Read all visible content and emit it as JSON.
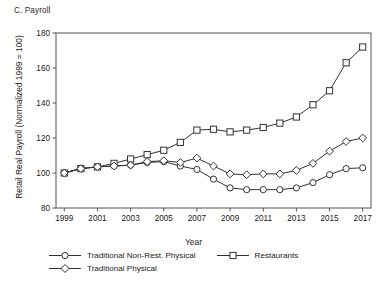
{
  "figure": {
    "panel_title": "C. Payroll",
    "ylabel": "Retail Real Payroll (Normalized 1999 = 100)",
    "xlabel": "Year"
  },
  "legend": {
    "items": [
      {
        "label": "Traditional Non-Rest. Physical",
        "marker": "circle-marker"
      },
      {
        "label": "Restaurants",
        "marker": "square-marker"
      },
      {
        "label": "Traditional Physical",
        "marker": "diamond-marker"
      }
    ]
  },
  "chart_data": {
    "type": "line",
    "title": "C. Payroll",
    "xlabel": "Year",
    "ylabel": "Retail Real Payroll (Normalized 1999 = 100)",
    "x": [
      1999,
      2000,
      2001,
      2002,
      2003,
      2004,
      2005,
      2006,
      2007,
      2008,
      2009,
      2010,
      2011,
      2012,
      2013,
      2014,
      2015,
      2016,
      2017
    ],
    "xlim": [
      1998.5,
      2017.5
    ],
    "ylim": [
      80,
      180
    ],
    "xticks": [
      1999,
      2001,
      2003,
      2005,
      2007,
      2009,
      2011,
      2013,
      2015,
      2017
    ],
    "yticks": [
      80,
      100,
      120,
      140,
      160,
      180
    ],
    "grid": false,
    "legend_position": "below",
    "series": [
      {
        "name": "Traditional Non-Rest. Physical",
        "marker": "circle",
        "values": [
          100.0,
          102.5,
          103.5,
          104.0,
          104.5,
          106.0,
          106.5,
          104.0,
          102.0,
          96.5,
          91.5,
          90.5,
          90.5,
          90.5,
          91.5,
          94.5,
          99.0,
          102.5,
          103.0
        ]
      },
      {
        "name": "Restaurants",
        "marker": "square",
        "values": [
          100.0,
          102.5,
          103.5,
          105.5,
          108.0,
          110.5,
          113.0,
          117.5,
          124.5,
          125.0,
          123.5,
          124.5,
          126.0,
          128.5,
          132.0,
          139.0,
          147.0,
          163.0,
          172.0
        ]
      },
      {
        "name": "Traditional Physical",
        "marker": "diamond",
        "values": [
          100.0,
          102.5,
          103.5,
          104.0,
          104.5,
          106.5,
          107.0,
          106.0,
          108.5,
          104.0,
          99.5,
          99.0,
          99.5,
          99.5,
          101.5,
          105.5,
          112.5,
          118.0,
          120.0
        ]
      }
    ]
  }
}
